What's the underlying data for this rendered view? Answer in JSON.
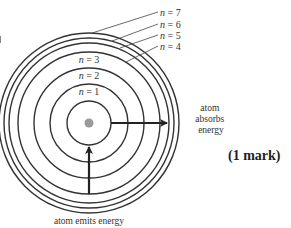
{
  "diagram": {
    "center": {
      "x": 89,
      "y": 123
    },
    "nucleus": {
      "radius": 4.5,
      "color": "#999999"
    },
    "stroke_color": "#333333",
    "levels": [
      {
        "n": "1",
        "label": "n = 1",
        "radius": 22
      },
      {
        "n": "2",
        "label": "n = 2",
        "radius": 39
      },
      {
        "n": "3",
        "label": "n = 3",
        "radius": 55
      },
      {
        "n": "4",
        "label": "n = 4",
        "radius": 71
      },
      {
        "n": "5",
        "label": "n = 5",
        "radius": 80
      },
      {
        "n": "6",
        "label": "n = 6",
        "radius": 85
      },
      {
        "n": "7",
        "label": "n = 7",
        "radius": 90
      }
    ],
    "inner_labels": {
      "n1": {
        "var": "n",
        "rest": " = 1"
      },
      "n2": {
        "var": "n",
        "rest": " = 2"
      },
      "n3": {
        "var": "n",
        "rest": " = 3"
      }
    },
    "outer_labels": {
      "n4": {
        "var": "n",
        "rest": " = 4"
      },
      "n5": {
        "var": "n",
        "rest": " = 5"
      },
      "n6": {
        "var": "n",
        "rest": " = 6"
      },
      "n7": {
        "var": "n",
        "rest": " = 7"
      }
    },
    "absorb_arrow": {
      "caption_lines": [
        "atom",
        "absorbs",
        "energy"
      ],
      "from_level": "1",
      "to_level": "5"
    },
    "emit_arrow": {
      "caption": "atom emits energy",
      "from_level": "4",
      "to_level": "1"
    }
  },
  "marks": "(1 mark)"
}
